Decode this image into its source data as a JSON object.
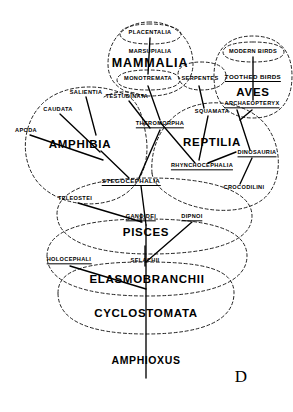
{
  "figure": {
    "letter": "D",
    "width": 293,
    "height": 412,
    "line_color": "#000000",
    "cluster_color": "#222222",
    "background": "#ffffff"
  },
  "taxa": {
    "placentalia": {
      "label": "PLACENTALIA",
      "x": 150,
      "y": 33,
      "rank": "minor",
      "extinct": false
    },
    "marsupialia": {
      "label": "MARSUPIALIA",
      "x": 150,
      "y": 52,
      "rank": "minor",
      "extinct": false
    },
    "mammalia": {
      "label": "MAMMALIA",
      "x": 150,
      "y": 64,
      "rank": "major-lg",
      "extinct": false
    },
    "monotremata": {
      "label": "MONOTREMATA",
      "x": 148,
      "y": 79,
      "rank": "minor",
      "extinct": false
    },
    "serpentes": {
      "label": "SERPENTES",
      "x": 200,
      "y": 79,
      "rank": "minor",
      "extinct": false
    },
    "modern_birds": {
      "label": "MODERN BIRDS",
      "x": 253,
      "y": 52,
      "rank": "minor",
      "extinct": false
    },
    "toothed_birds": {
      "label": "TOOTHED BIRDS",
      "x": 253,
      "y": 78,
      "rank": "minor-b",
      "extinct": true
    },
    "aves": {
      "label": "AVES",
      "x": 253,
      "y": 92,
      "rank": "major",
      "extinct": false
    },
    "archaeopteryx": {
      "label": "ARCHAEOPTERYX",
      "x": 252,
      "y": 105,
      "rank": "minor",
      "extinct": true
    },
    "salientia": {
      "label": "SALIENTIA",
      "x": 86,
      "y": 93,
      "rank": "minor",
      "extinct": false
    },
    "testudinata": {
      "label": "TESTUDINATA",
      "x": 127,
      "y": 97,
      "rank": "minor",
      "extinct": false
    },
    "squamata": {
      "label": "SQUAMATA",
      "x": 212,
      "y": 112,
      "rank": "minor",
      "extinct": false
    },
    "caudata": {
      "label": "CAUDATA",
      "x": 58,
      "y": 110,
      "rank": "minor",
      "extinct": false
    },
    "theromorpha": {
      "label": "THEROMORPHA",
      "x": 160,
      "y": 125,
      "rank": "minor",
      "extinct": true
    },
    "apoda": {
      "label": "APODA",
      "x": 26,
      "y": 131,
      "rank": "minor",
      "extinct": false
    },
    "amphibia": {
      "label": "AMPHIBIA",
      "x": 80,
      "y": 144,
      "rank": "major",
      "extinct": false
    },
    "reptilia": {
      "label": "REPTILIA",
      "x": 212,
      "y": 142,
      "rank": "major",
      "extinct": false
    },
    "dinosauria": {
      "label": "DINOSAURIA",
      "x": 257,
      "y": 154,
      "rank": "minor",
      "extinct": true
    },
    "rhynchocephalia": {
      "label": "RHYNCHOCEPHALIA",
      "x": 202,
      "y": 167,
      "rank": "minor",
      "extinct": true
    },
    "stegocephalia": {
      "label": "STEGOCEPHALIA",
      "x": 131,
      "y": 182,
      "rank": "minor-b",
      "extinct": true
    },
    "crocodilini": {
      "label": "CROCODILINI",
      "x": 244,
      "y": 188,
      "rank": "minor",
      "extinct": false
    },
    "teleostei": {
      "label": "TELEOSTEI",
      "x": 75,
      "y": 199,
      "rank": "minor",
      "extinct": false
    },
    "ganoidei": {
      "label": "GANOIDEI",
      "x": 141,
      "y": 218,
      "rank": "minor",
      "extinct": true
    },
    "dipnoi": {
      "label": "DIPNOI",
      "x": 192,
      "y": 218,
      "rank": "minor",
      "extinct": true
    },
    "pisces": {
      "label": "PISCES",
      "x": 146,
      "y": 232,
      "rank": "major",
      "extinct": false
    },
    "holocephali": {
      "label": "HOLOCEPHALI",
      "x": 69,
      "y": 261,
      "rank": "minor",
      "extinct": true
    },
    "selachii": {
      "label": "SELACHII",
      "x": 145,
      "y": 261,
      "rank": "minor",
      "extinct": false
    },
    "elasmobranchii": {
      "label": "ELASMOBRANCHII",
      "x": 147,
      "y": 279,
      "rank": "major",
      "extinct": false
    },
    "cyclostomata": {
      "label": "CYCLOSTOMATA",
      "x": 146,
      "y": 313,
      "rank": "major",
      "extinct": false
    },
    "amphioxus": {
      "label": "AMPHIOXUS",
      "x": 146,
      "y": 361,
      "rank": "major-sm",
      "extinct": false
    }
  }
}
